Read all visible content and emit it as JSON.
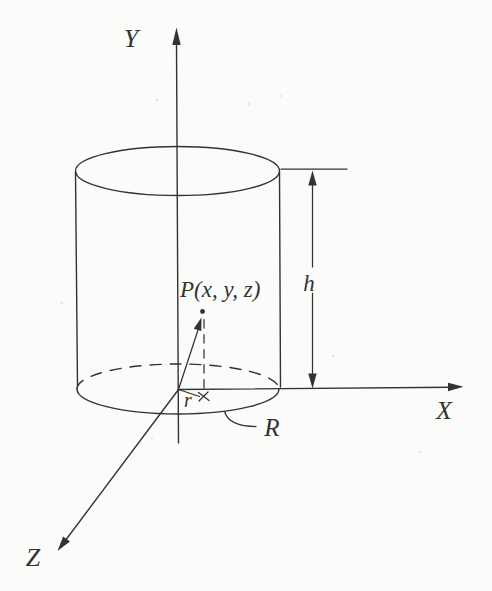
{
  "figure": {
    "labels": {
      "axis_y": "Y",
      "axis_x": "X",
      "axis_z": "Z",
      "point_p": "P(x, y, z)",
      "height": "h",
      "radial_coord": "r",
      "radius": "R"
    },
    "colors": {
      "ink": "#333333",
      "paper": "#fbfbf9"
    }
  }
}
